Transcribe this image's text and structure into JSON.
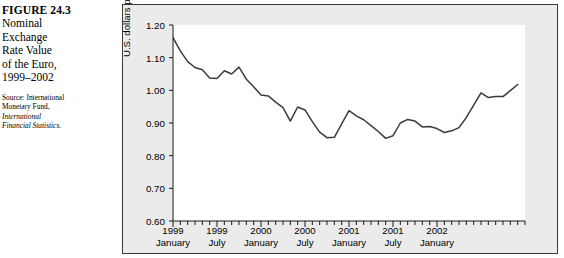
{
  "caption": {
    "figure_number": "FIGURE 24.3",
    "title_lines": [
      "Nominal",
      "Exchange",
      "Rate Value",
      "of the Euro,",
      "1999–2002"
    ],
    "source_prefix": "Source: International",
    "source_line2": "Monetary Fund,",
    "source_italic_line1": "International",
    "source_italic_line2": "Financial Statistics."
  },
  "chart_data": {
    "type": "line",
    "title": "Nominal Exchange Rate Value of the Euro, 1999–2002",
    "xlabel": "",
    "ylabel": "U.S. dollars per euro",
    "ylim": [
      0.6,
      1.2
    ],
    "ytick_labels": [
      "1.20",
      "1.10",
      "1.00",
      "0.90",
      "0.80",
      "0.70",
      "0.60"
    ],
    "ytick_values": [
      1.2,
      1.1,
      1.0,
      0.9,
      0.8,
      0.7,
      0.6
    ],
    "grid": false,
    "legend": null,
    "xtick_labels": [
      {
        "year": "1999",
        "month": "January",
        "index": 0
      },
      {
        "year": "1999",
        "month": "July",
        "index": 6
      },
      {
        "year": "2000",
        "month": "January",
        "index": 12
      },
      {
        "year": "2000",
        "month": "July",
        "index": 18
      },
      {
        "year": "2001",
        "month": "January",
        "index": 24
      },
      {
        "year": "2001",
        "month": "July",
        "index": 30
      },
      {
        "year": "2002",
        "month": "January",
        "index": 36
      }
    ],
    "minor_tick_count": 48,
    "x": [
      "1999-01",
      "1999-02",
      "1999-03",
      "1999-04",
      "1999-05",
      "1999-06",
      "1999-07",
      "1999-08",
      "1999-09",
      "1999-10",
      "1999-11",
      "1999-12",
      "2000-01",
      "2000-02",
      "2000-03",
      "2000-04",
      "2000-05",
      "2000-06",
      "2000-07",
      "2000-08",
      "2000-09",
      "2000-10",
      "2000-11",
      "2000-12",
      "2001-01",
      "2001-02",
      "2001-03",
      "2001-04",
      "2001-05",
      "2001-06",
      "2001-07",
      "2001-08",
      "2001-09",
      "2001-10",
      "2001-11",
      "2001-12",
      "2002-01",
      "2002-02",
      "2002-03",
      "2002-04",
      "2002-05",
      "2002-06",
      "2002-07",
      "2002-08",
      "2002-09",
      "2002-10",
      "2002-11",
      "2002-12"
    ],
    "series": [
      {
        "name": "U.S. dollars per euro",
        "color": "#3b3b3b",
        "values": [
          1.161,
          1.121,
          1.088,
          1.07,
          1.063,
          1.038,
          1.036,
          1.06,
          1.05,
          1.071,
          1.034,
          1.011,
          0.986,
          0.983,
          0.964,
          0.947,
          0.906,
          0.949,
          0.94,
          0.904,
          0.872,
          0.855,
          0.856,
          0.897,
          0.938,
          0.922,
          0.91,
          0.892,
          0.874,
          0.853,
          0.861,
          0.9,
          0.911,
          0.906,
          0.888,
          0.889,
          0.883,
          0.871,
          0.876,
          0.886,
          0.917,
          0.955,
          0.992,
          0.978,
          0.981,
          0.981,
          0.999,
          1.018
        ]
      }
    ],
    "note": "Series plotted left-to-right ends near 0.96 at right edge of plotted range."
  }
}
